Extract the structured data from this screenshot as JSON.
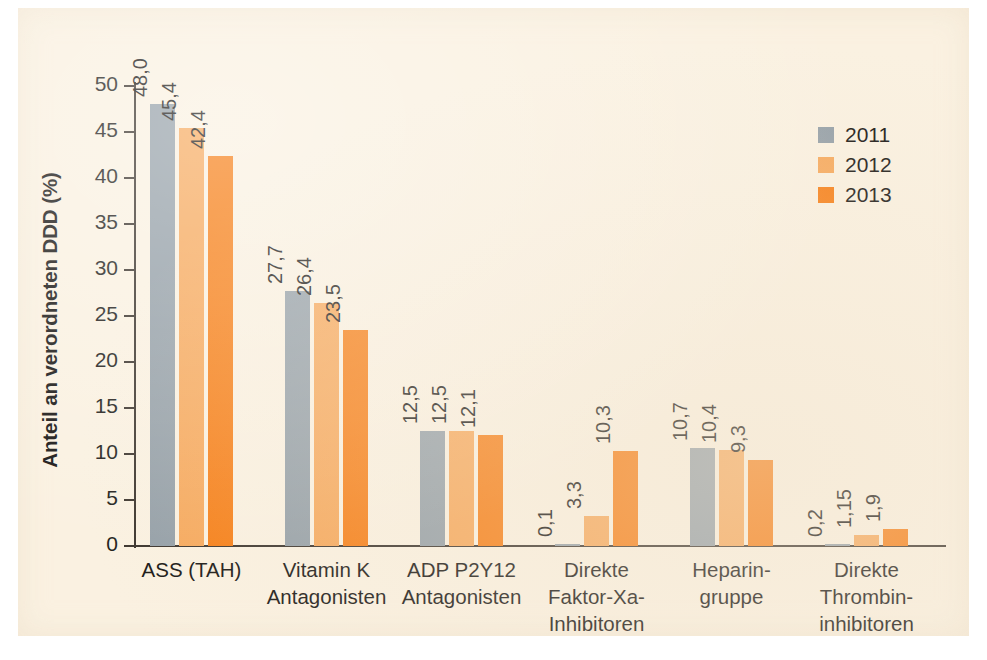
{
  "chart_data": {
    "type": "bar",
    "title": "",
    "subtitle": "",
    "xlabel": "",
    "ylabel": "Anteil an verordneten DDD (%)",
    "ylim": [
      0,
      50
    ],
    "ytick_values": [
      0,
      5,
      10,
      15,
      20,
      25,
      30,
      35,
      40,
      45,
      50
    ],
    "ytick_labels": [
      "0",
      "5",
      "10",
      "15",
      "20",
      "25",
      "30",
      "35",
      "40",
      "45",
      "50"
    ],
    "grid": false,
    "legend_position": "top-right",
    "decimal_separator": ",",
    "categories": [
      "ASS (TAH)",
      "Vitamin K\nAntagonisten",
      "ADP P2Y12\nAntagonisten",
      "Direkte\nFaktor-Xa-\nInhibitoren",
      "Heparin-\ngruppe",
      "Direkte\nThrombin-\ninhibitoren"
    ],
    "series": [
      {
        "name": "2011",
        "color": "#95a0a8",
        "values": [
          48.0,
          27.7,
          12.5,
          0.1,
          10.7,
          0.2
        ],
        "labels": [
          "48,0",
          "27,7",
          "12,5",
          "0,1",
          "10,7",
          "0,2"
        ]
      },
      {
        "name": "2012",
        "color": "#f6a95d",
        "values": [
          45.4,
          26.4,
          12.5,
          3.3,
          10.4,
          1.15
        ],
        "labels": [
          "45,4",
          "26,4",
          "12,5",
          "3,3",
          "10,4",
          "1,15"
        ]
      },
      {
        "name": "2013",
        "color": "#f67f17",
        "values": [
          42.4,
          23.5,
          12.1,
          10.3,
          9.3,
          1.9
        ],
        "labels": [
          "42,4",
          "23,5",
          "12,1",
          "10,3",
          "9,3",
          "1,9"
        ]
      }
    ]
  },
  "legend": {
    "entries": [
      {
        "label": "2011",
        "color": "#95a0a8"
      },
      {
        "label": "2012",
        "color": "#f6a95d"
      },
      {
        "label": "2013",
        "color": "#f67f17"
      }
    ]
  },
  "colors": {
    "panel_background": "#faf1e1",
    "page_background": "#ffffff",
    "axis": "#3c352e",
    "text": "#1b1917",
    "series_2011": "#95a0a8",
    "series_2012": "#f6a95d",
    "series_2013": "#f67f17"
  }
}
